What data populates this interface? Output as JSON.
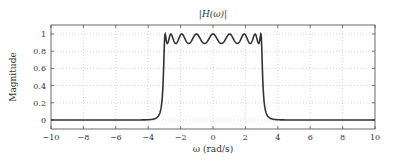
{
  "chart_data": {
    "type": "line",
    "title": "|H(ω)|",
    "xlabel": "ω (rad/s)",
    "ylabel": "Magnitude",
    "xlim": [
      -10,
      10
    ],
    "ylim": [
      -0.1,
      1.1
    ],
    "xticks": [
      -10,
      -8,
      -6,
      -4,
      -2,
      0,
      2,
      4,
      6,
      8,
      10
    ],
    "yticks": [
      0,
      0.2,
      0.4,
      0.6,
      0.8,
      1
    ],
    "xtick_labels": [
      "−10",
      "−8",
      "−6",
      "−4",
      "−2",
      "0",
      "2",
      "4",
      "6",
      "8",
      "10"
    ],
    "ytick_labels": [
      "0",
      "0.2",
      "0.4",
      "0.6",
      "0.8",
      "1"
    ],
    "grid": true,
    "legend": null,
    "series": [
      {
        "name": "|H(ω)|",
        "filter": "Chebyshev type I lowpass",
        "order": 9,
        "cutoff": 3,
        "ripple_min": 0.89,
        "color": "#333333"
      }
    ]
  }
}
